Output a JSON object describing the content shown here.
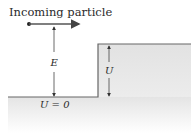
{
  "figure": {
    "title": "Incoming particle",
    "energy_label": "E",
    "barrier_label": "U",
    "ground_label": "U = 0"
  },
  "colors": {
    "line": "#555555",
    "fill_top": "#e6e6e6",
    "fill_bottom": "#ffffff",
    "text": "#2a2a2a"
  }
}
